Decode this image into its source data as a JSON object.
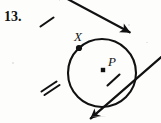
{
  "page": {
    "width": 161,
    "height": 123,
    "background_color": "#fdfdfc",
    "ink_color": "#111111"
  },
  "problem": {
    "number_label": "13.",
    "kind": "geometry-construction-figure",
    "description": "Two rays crossing at point X outside-on a circle with center P"
  },
  "figure": {
    "labels": {
      "intersection_point": "X",
      "circle_center": "P"
    },
    "circle": {
      "name": "circle-P",
      "center_x": 102,
      "center_y": 73,
      "radius": 34,
      "stroke_width": 2.1
    },
    "center_dot": {
      "name": "center-point-P",
      "x": 103,
      "y": 70,
      "size": 4
    },
    "intersection_dot": {
      "name": "intersection-point-X",
      "x": 79,
      "y": 48,
      "size": 5
    },
    "lines": [
      {
        "name": "secant-line",
        "x1": 36,
        "y1": 105,
        "x2": 152,
        "y2": 116,
        "note": "ray from lower-left through X and P to lower-right",
        "stroke_width": 2.2
      },
      {
        "name": "crossing-line",
        "x1": 32,
        "y1": 8,
        "x2": 118,
        "y2": 12,
        "note": "ray from upper-left through X to upper-right",
        "stroke_width": 2.2
      }
    ],
    "arrowheads": [
      {
        "name": "arrowhead-upper-left",
        "x": 32,
        "y": 8
      },
      {
        "name": "arrowhead-upper-right",
        "x": 118,
        "y": 12
      },
      {
        "name": "arrowhead-lower-left",
        "x": 36,
        "y": 105
      },
      {
        "name": "arrowhead-lower-right",
        "x": 152,
        "y": 116
      }
    ],
    "tick_marks": [
      {
        "name": "tick-single-upper-left",
        "x": 47,
        "y": 22,
        "count": 1,
        "note": "congruence tick on upper-left ray"
      },
      {
        "name": "tick-double-lower-left",
        "x": 50,
        "y": 87,
        "count": 2,
        "note": "double congruence tick on lower-left ray"
      },
      {
        "name": "tick-single-right-of-P",
        "x": 113,
        "y": 80,
        "count": 1,
        "note": "congruence tick on radius segment right of P"
      }
    ]
  }
}
